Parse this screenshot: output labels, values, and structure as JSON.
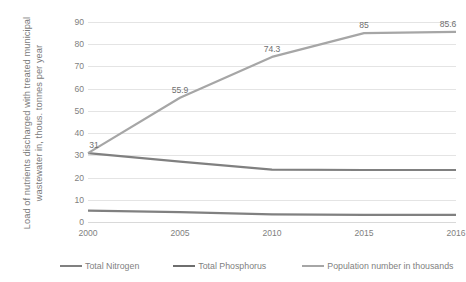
{
  "chart_data": {
    "type": "line",
    "title": "",
    "xlabel": "",
    "ylabel": "Load of nutrients discharged with treated municipal wastewater in, thous. tonnes per year",
    "categories": [
      "2000",
      "2005",
      "2010",
      "2015",
      "2016"
    ],
    "ylim": [
      0,
      90
    ],
    "yticks": [
      0,
      10,
      20,
      30,
      40,
      50,
      60,
      70,
      80,
      90
    ],
    "grid": true,
    "legend_position": "bottom",
    "series": [
      {
        "name": "Total Nitrogen",
        "color": "#808080",
        "values": [
          31,
          27.2,
          23.6,
          23.4,
          23.4
        ],
        "labels": [
          "31",
          "",
          "",
          "",
          ""
        ]
      },
      {
        "name": "Total Phosphorus",
        "color": "#808080",
        "values": [
          5.1,
          4.4,
          3.4,
          3.2,
          3.2
        ],
        "labels": [
          "",
          "",
          "",
          "",
          ""
        ]
      },
      {
        "name": "Population number in thousands",
        "color": "#a6a6a6",
        "values": [
          31,
          55.9,
          74.3,
          85,
          85.6
        ],
        "labels": [
          "",
          "55.9",
          "74.3",
          "85",
          "85.6"
        ]
      }
    ]
  },
  "axis": {
    "y_title_text": "Load of nutrients discharged with treated municipal wastewater in, thous. tonnes per year",
    "y_tick_labels": [
      "90",
      "80",
      "70",
      "60",
      "50",
      "40",
      "30",
      "20",
      "10",
      "0"
    ],
    "x_tick_labels": [
      "2000",
      "2005",
      "2010",
      "2015",
      "2016"
    ]
  },
  "legend": {
    "items": [
      {
        "label": "Total Nitrogen",
        "color": "#808080"
      },
      {
        "label": "Total Phosphorus",
        "color": "#6e6e6e"
      },
      {
        "label": "Population number in thousands",
        "color": "#a6a6a6"
      }
    ]
  },
  "data_labels": [
    {
      "text": "31",
      "series": "Total Nitrogen",
      "x": "2000"
    },
    {
      "text": "55.9",
      "series": "Population number in thousands",
      "x": "2005"
    },
    {
      "text": "74.3",
      "series": "Population number in thousands",
      "x": "2010"
    },
    {
      "text": "85",
      "series": "Population number in thousands",
      "x": "2015"
    },
    {
      "text": "85.6",
      "series": "Population number in thousands",
      "x": "2016"
    }
  ]
}
